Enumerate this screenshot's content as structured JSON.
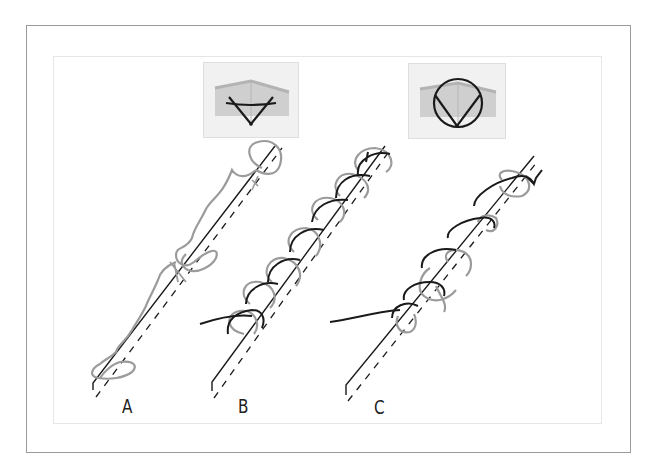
{
  "figure": {
    "insets": [
      {
        "id": "inset-1",
        "shows": "cross-section with shallow V-shaped suture path"
      },
      {
        "id": "inset-2",
        "shows": "cross-section with circular suture path"
      }
    ],
    "panels": [
      {
        "id": "A",
        "label": "A"
      },
      {
        "id": "B",
        "label": "B"
      },
      {
        "id": "C",
        "label": "C"
      }
    ],
    "colors": {
      "frame": "#9a9a9a",
      "inner_frame": "#e6e6e6",
      "inset_bg": "#f1f1f1",
      "tissue": "#cfcfcf",
      "tissue_edge": "#b9b9b9",
      "suture_dark": "#1a1a1a",
      "suture_light": "#9b9b9b"
    }
  }
}
